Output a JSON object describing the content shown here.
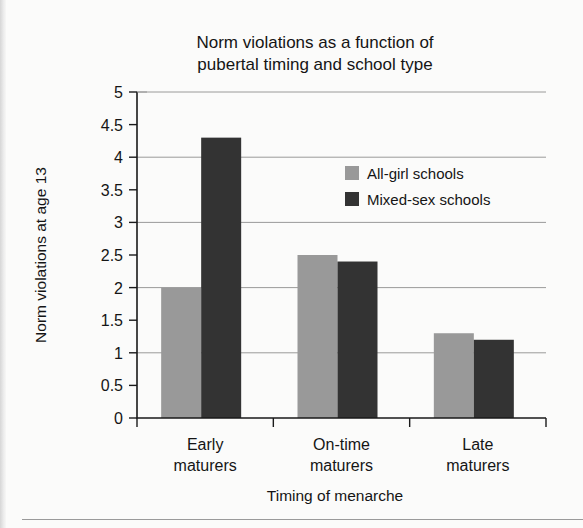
{
  "figure": {
    "ghost_text": "",
    "background_color": "#fbfbfa"
  },
  "chart_data": {
    "type": "bar",
    "title": "Norm violations as a function of pubertal timing and school type",
    "title_lines": [
      "Norm violations as a function of",
      "pubertal timing and school type"
    ],
    "xlabel": "Timing of menarche",
    "ylabel": "Norm violations at age 13",
    "categories": [
      "Early maturers",
      "On-time maturers",
      "Late maturers"
    ],
    "category_lines": [
      [
        "Early",
        "maturers"
      ],
      [
        "On-time",
        "maturers"
      ],
      [
        "Late",
        "maturers"
      ]
    ],
    "series": [
      {
        "name": "All-girl schools",
        "color": "#999999",
        "values": [
          2.0,
          2.5,
          1.3
        ]
      },
      {
        "name": "Mixed-sex schools",
        "color": "#333333",
        "values": [
          4.3,
          2.4,
          1.2
        ]
      }
    ],
    "ylim": [
      0,
      5
    ],
    "ytick_values": [
      0,
      0.5,
      1,
      1.5,
      2,
      2.5,
      3,
      3.5,
      4,
      4.5,
      5
    ],
    "ytick_labels": [
      "0",
      "0.5",
      "1",
      "1.5",
      "2",
      "2.5",
      "3",
      "3.5",
      "4",
      "4.5",
      "5"
    ],
    "gridline_values": [
      1,
      2,
      3,
      4,
      5
    ],
    "grid": true,
    "legend_position": "upper-right-inside"
  }
}
